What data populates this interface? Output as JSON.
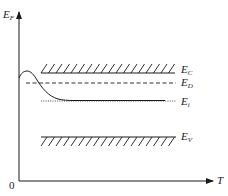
{
  "diagram": {
    "type": "energy-band-vs-temperature",
    "y_axis": {
      "label_main": "E",
      "label_sub": "F"
    },
    "x_axis": {
      "label": "T",
      "origin_label": "0"
    },
    "levels": [
      {
        "id": "conduction-band",
        "label_main": "E",
        "label_sub": "C",
        "style": "solid-hatched-above"
      },
      {
        "id": "donor-level",
        "label_main": "E",
        "label_sub": "D",
        "style": "dashed"
      },
      {
        "id": "intrinsic-level",
        "label_main": "E",
        "label_sub": "i",
        "style": "dotted"
      },
      {
        "id": "valence-band",
        "label_main": "E",
        "label_sub": "V",
        "style": "solid-hatched-below"
      }
    ],
    "curve": {
      "id": "fermi-level-curve",
      "description": "Fermi level rises slightly, then decreases toward E_i as temperature increases"
    },
    "colors": {
      "line": "#1a1a1a",
      "background": "#ffffff"
    }
  }
}
